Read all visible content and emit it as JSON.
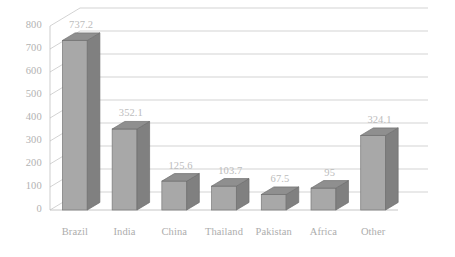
{
  "chart_data": {
    "type": "bar",
    "title": "",
    "subtitle": "",
    "xlabel": "",
    "ylabel": "",
    "categories": [
      "Brazil",
      "India",
      "China",
      "Thailand",
      "Pakistan",
      "Africa",
      "Other"
    ],
    "values": [
      737.2,
      352.1,
      125.6,
      103.7,
      67.5,
      95,
      324.1
    ],
    "value_labels": [
      "737.2",
      "352.1",
      "125.6",
      "103.7",
      "67.5",
      "95",
      "324.1"
    ],
    "ylim": [
      0,
      800
    ],
    "yticks": [
      0,
      100,
      200,
      300,
      400,
      500,
      600,
      700,
      800
    ],
    "ytick_labels": [
      "0",
      "100",
      "200",
      "300",
      "400",
      "500",
      "600",
      "700",
      "800"
    ],
    "grid": true,
    "legend": false,
    "legend_position": "none",
    "three_d": true,
    "colors": {
      "bar_front": "#a8a8a8",
      "bar_side": "#808080",
      "bar_top": "#8f8f8f",
      "gridline": "#c8c8c8",
      "axis": "#c0c0c0",
      "tick_text": "#b2b2b2",
      "category_text": "#adadad",
      "value_text": "#bcbcbc",
      "background": "#ffffff"
    }
  }
}
